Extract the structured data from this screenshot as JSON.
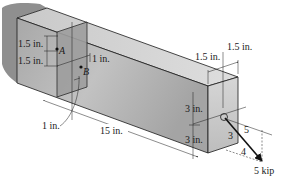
{
  "figure": {
    "type": "cantilever beam stress diagram",
    "colors": {
      "wall": "#8c8c8c",
      "beam_top": "#d2d2d2",
      "beam_front": "#b4b4b4",
      "beam_end": "#c8c8c8",
      "section_face": "#9a9a9a",
      "line": "#1a1a1a",
      "force_arrow": "#111111"
    }
  },
  "labels": {
    "a_offset_top": "1.5 in.",
    "a_offset_bottom": "1.5 in.",
    "b_offset": "1 in.",
    "b_depth": "1 in.",
    "length": "15 in.",
    "end_width_left": "1.5 in.",
    "end_width_right": "1.5 in.",
    "end_height_top": "3 in.",
    "end_height_bottom": "3 in.",
    "slope_vertical": "3",
    "slope_hypotenuse": "5",
    "slope_horizontal": "4",
    "force": "5 kip",
    "point_a": "A",
    "point_b": "B"
  }
}
